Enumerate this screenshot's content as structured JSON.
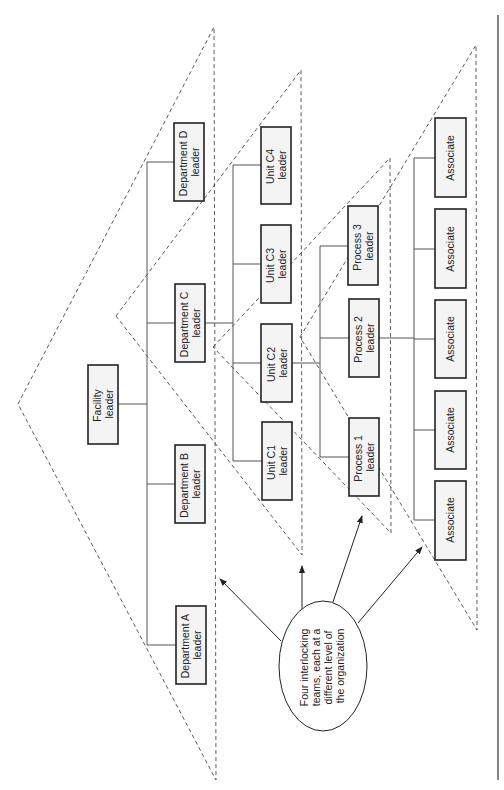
{
  "diagram": {
    "orientation": "rotated-90-ccw",
    "nodes": {
      "facility": {
        "line1": "Facility",
        "line2": "leader"
      },
      "dept_d": {
        "line1": "Department D",
        "line2": "leader"
      },
      "dept_c": {
        "line1": "Department C",
        "line2": "leader"
      },
      "dept_b": {
        "line1": "Department B",
        "line2": "leader"
      },
      "dept_a": {
        "line1": "Department A",
        "line2": "leader"
      },
      "unit_c4": {
        "line1": "Unit C4",
        "line2": "leader"
      },
      "unit_c3": {
        "line1": "Unit C3",
        "line2": "leader"
      },
      "unit_c2": {
        "line1": "Unit C2",
        "line2": "leader"
      },
      "unit_c1": {
        "line1": "Unit C1",
        "line2": "leader"
      },
      "process_3": {
        "line1": "Process 3",
        "line2": "leader"
      },
      "process_2": {
        "line1": "Process 2",
        "line2": "leader"
      },
      "process_1": {
        "line1": "Process 1",
        "line2": "leader"
      },
      "associates": [
        "Associate",
        "Associate",
        "Associate",
        "Associate",
        "Associate"
      ]
    },
    "callout": {
      "lines": [
        "Four interlocking",
        "teams, each at a",
        "different level of",
        "the organization"
      ]
    },
    "teams": [
      {
        "name": "Facility team",
        "members": [
          "Facility leader",
          "Department A leader",
          "Department B leader",
          "Department C leader",
          "Department D leader"
        ]
      },
      {
        "name": "Department C team",
        "members": [
          "Department C leader",
          "Unit C1 leader",
          "Unit C2 leader",
          "Unit C3 leader",
          "Unit C4 leader"
        ]
      },
      {
        "name": "Unit C2 team",
        "members": [
          "Unit C2 leader",
          "Process 1 leader",
          "Process 2 leader",
          "Process 3 leader"
        ]
      },
      {
        "name": "Process 2 team",
        "members": [
          "Process 2 leader",
          "Associate",
          "Associate",
          "Associate",
          "Associate",
          "Associate"
        ]
      }
    ]
  }
}
